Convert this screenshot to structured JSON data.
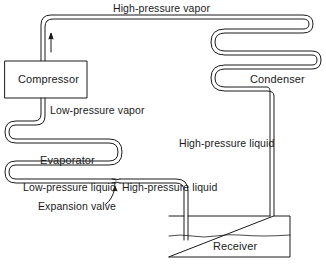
{
  "diagram": {
    "components": {
      "compressor": "Compressor",
      "condenser": "Condenser",
      "evaporator": "Evaporator",
      "receiver": "Receiver",
      "expansion_valve": "Expansion valve"
    },
    "flow_labels": {
      "high_pressure_vapor": "High-pressure vapor",
      "low_pressure_vapor": "Low-pressure vapor",
      "high_pressure_liquid_right": "High-pressure liquid",
      "low_pressure_liquid": "Low-pressure liquid",
      "high_pressure_liquid_bottom": "High-pressure liquid"
    },
    "colors": {
      "line": "#1a1a1a",
      "background": "#ffffff"
    }
  }
}
